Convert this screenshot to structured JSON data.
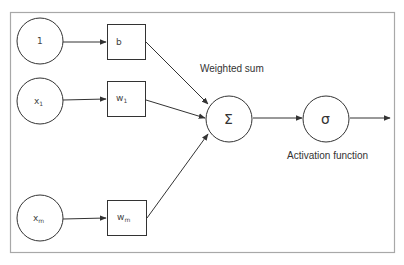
{
  "diagram": {
    "type": "perceptron",
    "inputs": [
      {
        "id": "bias-input",
        "label": "1",
        "subscript": ""
      },
      {
        "id": "x1-input",
        "label": "x",
        "subscript": "1"
      },
      {
        "id": "xm-input",
        "label": "x",
        "subscript": "m"
      }
    ],
    "weights": [
      {
        "id": "bias-weight",
        "label": "b",
        "subscript": ""
      },
      {
        "id": "w1-weight",
        "label": "w",
        "subscript": "1"
      },
      {
        "id": "wm-weight",
        "label": "w",
        "subscript": "m"
      }
    ],
    "sum_node": {
      "symbol": "Σ",
      "caption": "Weighted sum"
    },
    "activation_node": {
      "symbol": "σ",
      "caption": "Activation function"
    },
    "colors": {
      "stroke": "#333333",
      "frame": "#a8a8a8",
      "text": "#444444"
    }
  }
}
